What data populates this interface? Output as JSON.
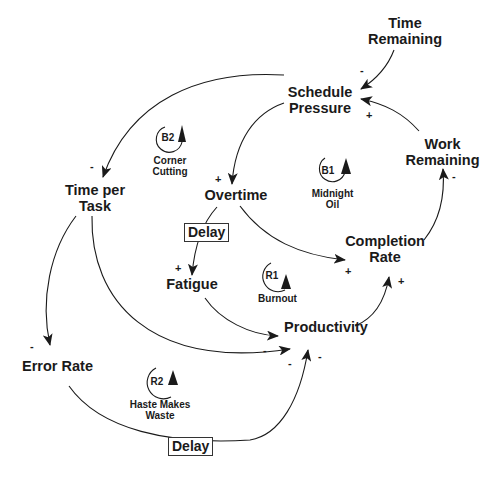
{
  "diagram": {
    "type": "causal-loop-diagram",
    "variables": [
      {
        "id": "time_remaining",
        "label_lines": [
          "Time",
          "Remaining"
        ]
      },
      {
        "id": "schedule_pressure",
        "label_lines": [
          "Schedule",
          "Pressure"
        ]
      },
      {
        "id": "work_remaining",
        "label_lines": [
          "Work",
          "Remaining"
        ]
      },
      {
        "id": "time_per_task",
        "label_lines": [
          "Time per",
          "Task"
        ]
      },
      {
        "id": "overtime",
        "label_lines": [
          "Overtime"
        ]
      },
      {
        "id": "completion_rate",
        "label_lines": [
          "Completion",
          "Rate"
        ]
      },
      {
        "id": "fatigue",
        "label_lines": [
          "Fatigue"
        ]
      },
      {
        "id": "productivity",
        "label_lines": [
          "Productivity"
        ]
      },
      {
        "id": "error_rate",
        "label_lines": [
          "Error Rate"
        ]
      }
    ],
    "loops": [
      {
        "id": "B2",
        "name_lines": [
          "Corner",
          "Cutting"
        ]
      },
      {
        "id": "B1",
        "name_lines": [
          "Midnight",
          "Oil"
        ]
      },
      {
        "id": "R1",
        "name_lines": [
          "Burnout"
        ]
      },
      {
        "id": "R2",
        "name_lines": [
          "Haste Makes",
          "Waste"
        ]
      }
    ],
    "delays": [
      {
        "label": "Delay",
        "link": "overtime->fatigue"
      },
      {
        "label": "Delay",
        "link": "error_rate->productivity"
      }
    ],
    "links": [
      {
        "from": "time_remaining",
        "to": "schedule_pressure",
        "polarity": "-"
      },
      {
        "from": "work_remaining",
        "to": "schedule_pressure",
        "polarity": "+"
      },
      {
        "from": "schedule_pressure",
        "to": "time_per_task",
        "polarity": "-"
      },
      {
        "from": "schedule_pressure",
        "to": "overtime",
        "polarity": "+"
      },
      {
        "from": "overtime",
        "to": "completion_rate",
        "polarity": "+"
      },
      {
        "from": "overtime",
        "to": "fatigue",
        "polarity": "+"
      },
      {
        "from": "completion_rate",
        "to": "work_remaining",
        "polarity": "-"
      },
      {
        "from": "fatigue",
        "to": "productivity",
        "polarity": "-"
      },
      {
        "from": "productivity",
        "to": "completion_rate",
        "polarity": "+"
      },
      {
        "from": "time_per_task",
        "to": "error_rate",
        "polarity": "-"
      },
      {
        "from": "time_per_task",
        "to": "productivity",
        "polarity": "-"
      },
      {
        "from": "error_rate",
        "to": "productivity",
        "polarity": "-"
      }
    ]
  },
  "colors": {
    "line": "#1a1a1a",
    "background": "#ffffff"
  }
}
